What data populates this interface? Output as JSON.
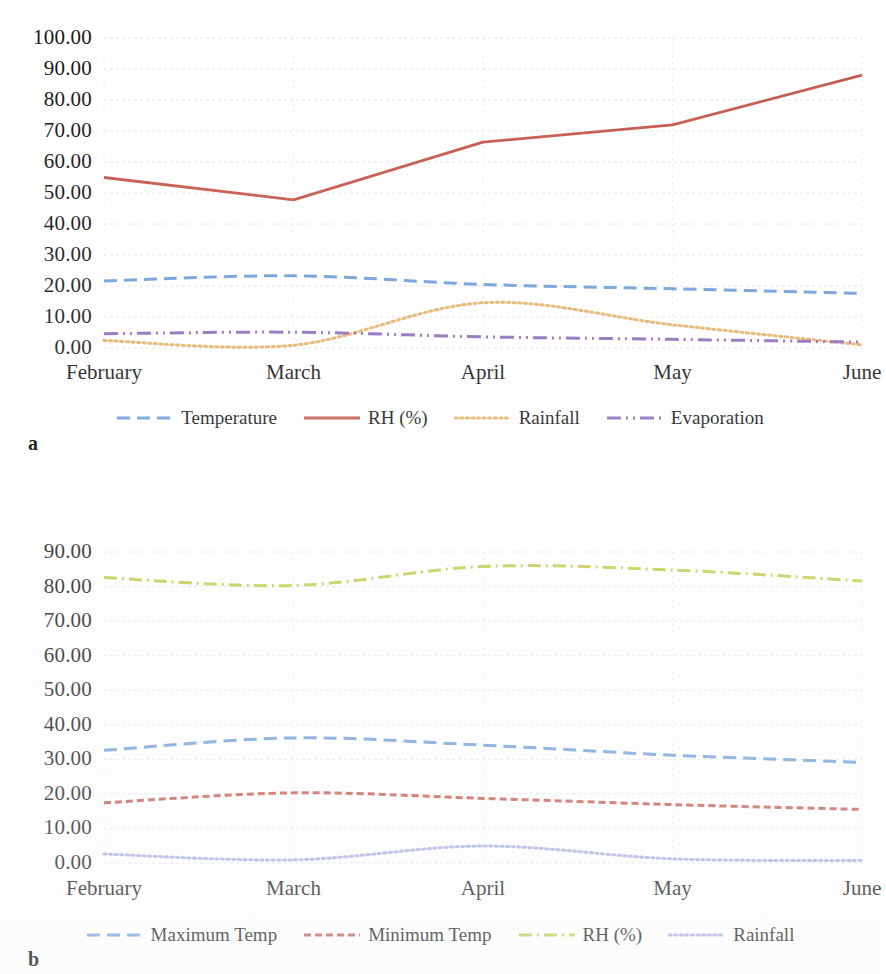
{
  "page": {
    "background": "#ffffff",
    "width": 880,
    "height": 974
  },
  "figures": [
    {
      "id": "a",
      "panel_label": "a",
      "x_categories": [
        "February",
        "March",
        "April",
        "May",
        "June"
      ],
      "y_ticks": [
        "0.00",
        "10.00",
        "20.00",
        "30.00",
        "40.00",
        "50.00",
        "60.00",
        "70.00",
        "80.00",
        "90.00",
        "100.00"
      ],
      "legend": [
        {
          "label": "Temperature",
          "color": "#6F9FD8",
          "style": "dashed"
        },
        {
          "label": "RH (%)",
          "color": "#C5584B",
          "style": "solid"
        },
        {
          "label": "Rainfall",
          "color": "#E8B26B",
          "style": "dotted"
        },
        {
          "label": "Evaporation",
          "color": "#8F6BBA",
          "style": "dashdotdot"
        }
      ]
    },
    {
      "id": "b",
      "panel_label": "b",
      "x_categories": [
        "February",
        "March",
        "April",
        "May",
        "June"
      ],
      "y_ticks": [
        "0.00",
        "10.00",
        "20.00",
        "30.00",
        "40.00",
        "50.00",
        "60.00",
        "70.00",
        "80.00",
        "90.00"
      ],
      "legend": [
        {
          "label": "Maximum Temp",
          "color": "#6F9FD8",
          "style": "dashed"
        },
        {
          "label": "Minimum Temp",
          "color": "#C5584B",
          "style": "dashed-short"
        },
        {
          "label": "RH (%)",
          "color": "#C3CC4A",
          "style": "dashdot"
        },
        {
          "label": "Rainfall",
          "color": "#A8AEDC",
          "style": "dotted"
        }
      ]
    }
  ],
  "chart_data": [
    {
      "type": "line",
      "panel": "a",
      "title": "",
      "xlabel": "",
      "ylabel": "",
      "categories": [
        "February",
        "March",
        "April",
        "May",
        "June"
      ],
      "ylim": [
        0,
        100
      ],
      "ytick_step": 10,
      "grid": true,
      "legend_position": "bottom",
      "series": [
        {
          "name": "Temperature",
          "color": "#6F9FD8",
          "style": "dashed",
          "values": [
            21.6,
            23.3,
            20.5,
            19.1,
            17.6
          ]
        },
        {
          "name": "RH (%)",
          "color": "#C5584B",
          "style": "solid",
          "values": [
            55.0,
            47.8,
            66.4,
            72.0,
            88.0
          ]
        },
        {
          "name": "Rainfall",
          "color": "#E8B26B",
          "style": "dotted",
          "values": [
            2.4,
            0.9,
            14.6,
            7.5,
            1.0
          ]
        },
        {
          "name": "Evaporation",
          "color": "#8F6BBA",
          "style": "dashdotdot",
          "values": [
            4.6,
            5.1,
            3.6,
            2.8,
            1.9
          ]
        }
      ]
    },
    {
      "type": "line",
      "panel": "b",
      "title": "",
      "xlabel": "",
      "ylabel": "",
      "categories": [
        "February",
        "March",
        "April",
        "May",
        "June"
      ],
      "ylim": [
        0,
        90
      ],
      "ytick_step": 10,
      "grid": true,
      "legend_position": "bottom",
      "series": [
        {
          "name": "Maximum Temp",
          "color": "#6F9FD8",
          "style": "dashed",
          "values": [
            32.6,
            36.2,
            34.1,
            31.2,
            29.1
          ]
        },
        {
          "name": "Minimum Temp",
          "color": "#C5584B",
          "style": "dashed-short",
          "values": [
            17.4,
            20.3,
            18.7,
            16.9,
            15.5
          ]
        },
        {
          "name": "RH (%)",
          "color": "#C3CC4A",
          "style": "dashdot",
          "values": [
            82.6,
            80.3,
            85.8,
            84.8,
            81.6
          ]
        },
        {
          "name": "Rainfall",
          "color": "#A8AEDC",
          "style": "dotted",
          "values": [
            2.6,
            0.9,
            4.9,
            1.2,
            0.7
          ]
        }
      ]
    }
  ]
}
